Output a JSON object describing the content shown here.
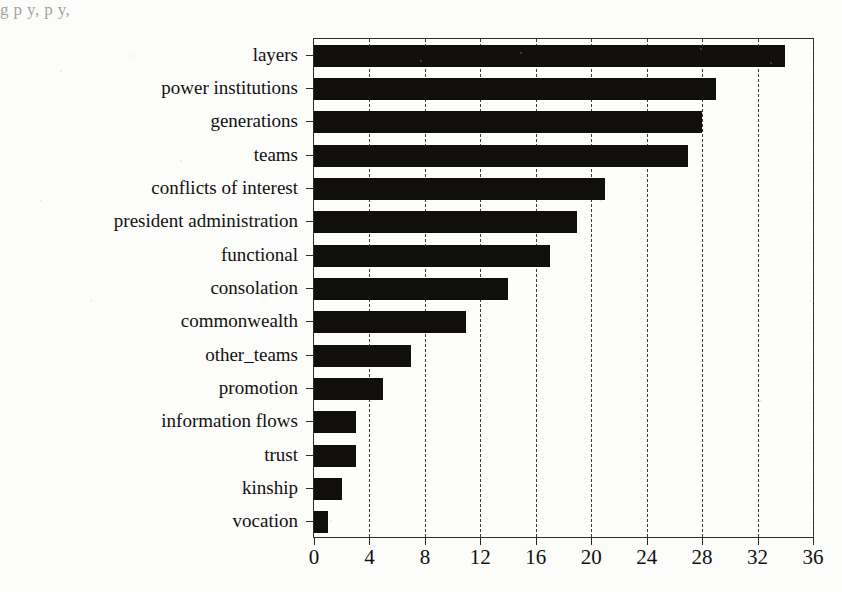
{
  "page": {
    "top_partial_text": "g  p y,                                                  p                 y,"
  },
  "chart_data": {
    "type": "bar",
    "orientation": "horizontal",
    "title": "",
    "subtitle": "",
    "xlabel": "",
    "ylabel": "",
    "categories": [
      "layers",
      "power institutions",
      "generations",
      "teams",
      "conflicts of interest",
      "president administration",
      "functional",
      "consolation",
      "commonwealth",
      "other_teams",
      "promotion",
      "information flows",
      "trust",
      "kinship",
      "vocation"
    ],
    "values": [
      34,
      29,
      28,
      27,
      21,
      19,
      17,
      14,
      11,
      7,
      5,
      3,
      3,
      2,
      1
    ],
    "xlim": [
      0,
      36
    ],
    "xticks": [
      0,
      4,
      8,
      12,
      16,
      20,
      24,
      28,
      32,
      36
    ],
    "xtick_labels": [
      "0",
      "4",
      "8",
      "12",
      "16",
      "20",
      "24",
      "28",
      "32",
      "36"
    ],
    "grid": true,
    "grid_axis": "x",
    "grid_style": "dashed",
    "legend": null,
    "legend_position": "none",
    "bar_color": "#100f0d",
    "background_color": "#fdfdfb",
    "axis_color": "#2b2b2b"
  }
}
